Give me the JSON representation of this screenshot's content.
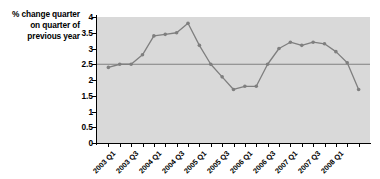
{
  "chart_data": {
    "type": "line",
    "title": "",
    "subtitle": "",
    "ylabel": "% change quarter on quarter of previous year",
    "ylabel_lines": [
      "% change quarter",
      "on quarter of",
      "previous year"
    ],
    "xlabel": "",
    "ylim": [
      0,
      4
    ],
    "y_ticks": [
      "0",
      "0.5",
      "1",
      "1.5",
      "2",
      "2.5",
      "3",
      "3.5",
      "4"
    ],
    "y_tick_values": [
      0,
      0.5,
      1,
      1.5,
      2,
      2.5,
      3,
      3.5,
      4
    ],
    "grid": false,
    "legend": "none",
    "plot_background": "#d9d9d9",
    "line_color": "#7f7f7f",
    "marker_color": "#7f7f7f",
    "reference_line": {
      "value": 2.5,
      "color": "#808080",
      "label": ""
    },
    "categories": [
      "2003 Q1",
      "2003 Q2",
      "2003 Q3",
      "2003 Q4",
      "2004 Q1",
      "2004 Q2",
      "2004 Q3",
      "2004 Q4",
      "2005 Q1",
      "2005 Q2",
      "2005 Q3",
      "2005 Q4",
      "2006 Q1",
      "2006 Q2",
      "2006 Q3",
      "2006 Q4",
      "2007 Q1",
      "2007 Q2",
      "2007 Q3",
      "2007 Q4",
      "2008 Q1"
    ],
    "tick_labels": [
      "2003 Q1",
      "2003 Q3",
      "2004 Q1",
      "2004 Q3",
      "2005 Q1",
      "2005 Q3",
      "2006 Q1",
      "2006 Q3",
      "2007 Q1",
      "2007 Q3",
      "2008 Q1"
    ],
    "values": [
      2.4,
      2.5,
      2.5,
      2.8,
      3.4,
      3.45,
      3.5,
      3.8,
      3.1,
      2.5,
      2.1,
      1.7,
      1.8,
      1.8,
      2.5,
      3.0,
      3.2,
      3.1,
      3.2,
      3.15,
      2.9
    ],
    "series": [
      {
        "name": "% change quarter on quarter of previous year",
        "values": [
          2.4,
          2.5,
          2.5,
          2.8,
          3.4,
          3.45,
          3.5,
          3.8,
          3.1,
          2.5,
          2.1,
          1.7,
          1.8,
          1.8,
          2.5,
          3.0,
          3.2,
          3.1,
          3.2,
          3.15,
          2.9
        ]
      }
    ],
    "extra_points": [
      {
        "x_index": 21,
        "value": 2.55
      },
      {
        "x_index": 22,
        "value": 1.7
      }
    ]
  }
}
